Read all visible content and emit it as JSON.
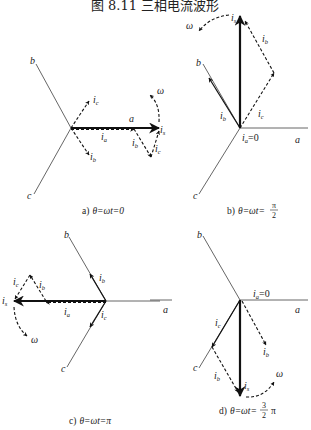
{
  "figure": {
    "title": "图 8.11   三相电流波形"
  },
  "panels": [
    {
      "id": "a",
      "caption_prefix": "a)",
      "caption_expr": "θ=ωt=0",
      "axes": {
        "a": "a",
        "b": "b",
        "c": "c"
      },
      "vectors": {
        "is": "i",
        "is_sub": "s",
        "ia": "i",
        "ia_sub": "a",
        "ib": "i",
        "ib_sub": "b",
        "ic": "i",
        "ic_sub": "c",
        "ib2": "i",
        "ib2_sub": "b",
        "ic2": "i",
        "ic2_sub": "c"
      },
      "omega": "ω"
    },
    {
      "id": "b",
      "caption_prefix": "b)",
      "caption_expr": "θ=ωt=",
      "caption_frac_num": "π",
      "caption_frac_den": "2",
      "axes": {
        "a": "a",
        "b": "b",
        "c": "c"
      },
      "vectors": {
        "is": "i",
        "is_sub": "s",
        "ia_zero": "=0",
        "ia": "i",
        "ia_sub": "a",
        "ib": "i",
        "ib_sub": "b",
        "ic": "i",
        "ic_sub": "c",
        "ib2": "i",
        "ib2_sub": "b"
      },
      "omega": "ω"
    },
    {
      "id": "c",
      "caption_prefix": "c)",
      "caption_expr": "θ=ωt=π",
      "axes": {
        "a": "a",
        "b": "b",
        "c": "c"
      },
      "vectors": {
        "is": "i",
        "is_sub": "s",
        "ia": "i",
        "ia_sub": "a",
        "ib": "i",
        "ib_sub": "b",
        "ic": "i",
        "ic_sub": "c",
        "ib2": "i",
        "ib2_sub": "b",
        "ic2": "i",
        "ic2_sub": "c"
      },
      "omega": "ω"
    },
    {
      "id": "d",
      "caption_prefix": "d)",
      "caption_expr": "θ=ωt=",
      "caption_frac_num": "3",
      "caption_frac_den": "2",
      "caption_suffix": "π",
      "axes": {
        "a": "a",
        "a_left": "a",
        "b": "b",
        "c": "c"
      },
      "vectors": {
        "is": "i",
        "is_sub": "s",
        "ia_zero": "=0",
        "ia": "i",
        "ia_sub": "a",
        "ib": "i",
        "ib_sub": "b",
        "ic": "i",
        "ic_sub": "c",
        "ib2": "i",
        "ib2_sub": "b"
      },
      "omega": "ω"
    }
  ]
}
